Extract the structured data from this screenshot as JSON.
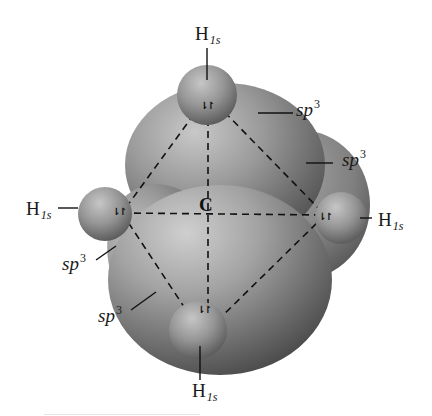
{
  "diagram": {
    "center_atom": {
      "label": "C"
    },
    "hydrogen_labels": [
      {
        "position": "top",
        "element": "H",
        "orbital": "1s"
      },
      {
        "position": "left",
        "element": "H",
        "orbital": "1s"
      },
      {
        "position": "right",
        "element": "H",
        "orbital": "1s"
      },
      {
        "position": "bottom",
        "element": "H",
        "orbital": "1s"
      }
    ],
    "hybrid_labels": [
      {
        "position": "upper-right",
        "base": "sp",
        "exponent": "3"
      },
      {
        "position": "right",
        "base": "sp",
        "exponent": "3"
      },
      {
        "position": "left",
        "base": "sp",
        "exponent": "3"
      },
      {
        "position": "lower-left",
        "base": "sp",
        "exponent": "3"
      }
    ],
    "electron_pair_symbol": "⇂↾",
    "colors": {
      "lobe_light": "#b8b8b8",
      "lobe_mid": "#8a8a8a",
      "lobe_dark": "#555555",
      "sphere_light": "#c4c4c4",
      "sphere_dark": "#6a6a6a",
      "dashed_line": "#111111",
      "background": "#ffffff"
    }
  }
}
